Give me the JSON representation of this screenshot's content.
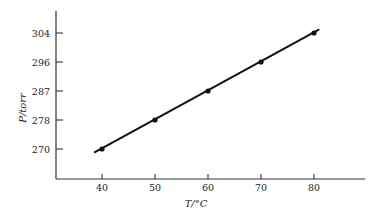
{
  "chart_data": {
    "type": "line",
    "title": "",
    "xlabel": "T/°C",
    "ylabel": "P/torr",
    "x": [
      40,
      50,
      60,
      70,
      80
    ],
    "series": [
      {
        "name": "P vs T",
        "values": [
          270,
          278,
          287,
          296,
          304
        ]
      }
    ],
    "x_ticks": [
      40,
      50,
      60,
      70,
      80
    ],
    "y_ticks": [
      270,
      278,
      287,
      296,
      304
    ],
    "fit_line": {
      "x_start": 38.5,
      "y_start": 269.0,
      "x_end": 81.0,
      "y_end": 305.0
    },
    "grid": false,
    "legend": "none",
    "colors": {
      "line": "#111111",
      "axis": "#333333",
      "marker": "#111111"
    }
  }
}
